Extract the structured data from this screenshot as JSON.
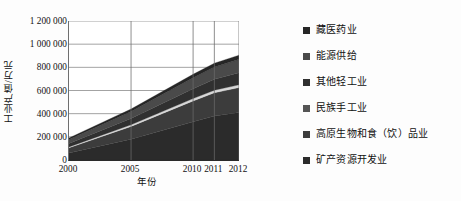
{
  "chart_data": {
    "type": "area",
    "stacked": true,
    "title": "",
    "xlabel": "年份",
    "ylabel": "工业产值/万元",
    "x": [
      2000,
      2005,
      2010,
      2011,
      2012
    ],
    "categories": [
      "2000",
      "2005",
      "2010",
      "2011",
      "2012"
    ],
    "xtick_labels": [
      "2000",
      "2005",
      "2010",
      "2011",
      "2012"
    ],
    "ytick_labels": [
      "0",
      "200 000",
      "400 000",
      "600 000",
      "800 000",
      "1 000 000",
      "1 200 000"
    ],
    "ytick_values": [
      0,
      200000,
      400000,
      600000,
      800000,
      1000000,
      1200000
    ],
    "ylim": [
      0,
      1200000
    ],
    "xlim": [
      2000,
      2012
    ],
    "grid": "horizontal-and-vertical",
    "legend_position": "right",
    "series": [
      {
        "name": "矿产资源开发业",
        "color": "#2b2b2b",
        "values": [
          60000,
          180000,
          330000,
          380000,
          410000
        ]
      },
      {
        "name": "高原生物和食（饮）品业",
        "color": "#3c3c3c",
        "values": [
          45000,
          110000,
          180000,
          200000,
          215000
        ]
      },
      {
        "name": "民族手工业",
        "color": "#d8d8d8",
        "values": [
          8000,
          14000,
          20000,
          22000,
          24000
        ]
      },
      {
        "name": "其他轻工业",
        "color": "#303030",
        "values": [
          30000,
          55000,
          85000,
          95000,
          105000
        ]
      },
      {
        "name": "能源供给",
        "color": "#4a4a4a",
        "values": [
          35000,
          60000,
          95000,
          105000,
          115000
        ]
      },
      {
        "name": "藏医药业",
        "color": "#262626",
        "values": [
          12000,
          21000,
          30000,
          33000,
          36000
        ]
      }
    ]
  },
  "legend": {
    "items": [
      {
        "label": "藏医药业",
        "color": "#262626"
      },
      {
        "label": "能源供给",
        "color": "#4a4a4a"
      },
      {
        "label": "其他轻工业",
        "color": "#303030"
      },
      {
        "label": "民族手工业",
        "color": "#555555"
      },
      {
        "label": "高原生物和食（饮）品业",
        "color": "#3c3c3c"
      },
      {
        "label": "矿产资源开发业",
        "color": "#2b2b2b"
      }
    ]
  }
}
